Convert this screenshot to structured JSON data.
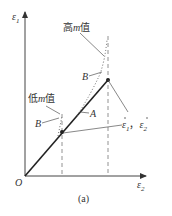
{
  "figure": {
    "caption": "(a)",
    "axes": {
      "y_label": "ε",
      "y_label_sub": "1",
      "x_label": "ε",
      "x_label_sub": "2",
      "origin_label": "O"
    },
    "annotations": {
      "high_m": {
        "prefix": "高",
        "m": "m",
        "suffix": "值"
      },
      "low_m": {
        "prefix": "低",
        "m": "m",
        "suffix": "值"
      },
      "point_b_upper": "B",
      "point_b_lower": "B",
      "point_a": "A",
      "rates": {
        "e1": "ε",
        "e1_sub": "1",
        "sep": "，",
        "e2": "ε",
        "e2_sub": "2"
      }
    },
    "colors": {
      "line": "#222222",
      "dashed": "#666666",
      "text": "#333333"
    }
  }
}
